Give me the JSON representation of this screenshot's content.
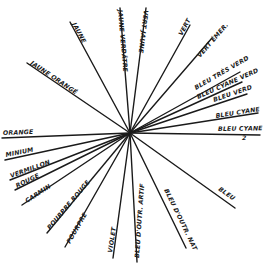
{
  "diagram": {
    "type": "radial-color-circle",
    "center": [
      130,
      133
    ],
    "ink_color": "#1a1a1a",
    "background": "#ffffff",
    "rays": [
      {
        "label": "JAUNE",
        "end": [
          70,
          22
        ],
        "text_pos": [
          72,
          24
        ],
        "text_angle": 61.5
      },
      {
        "label": "JAUNE VERDÂTRE",
        "end": [
          120,
          8
        ],
        "text_pos": [
          118,
          10
        ],
        "text_angle": 85
      },
      {
        "label": "VERT JAUNE",
        "end": [
          146,
          8
        ],
        "text_pos": [
          144,
          10
        ],
        "text_angle": 97
      },
      {
        "label": "VERT",
        "end": [
          190,
          25
        ],
        "text_pos": [
          182,
          36
        ],
        "text_angle": -61
      },
      {
        "label": "VERT ÉMER.",
        "end": [
          212,
          38
        ],
        "text_pos": [
          200,
          58
        ],
        "text_angle": -49
      },
      {
        "label": "BLEU TRÈS VERD",
        "end": [
          240,
          72
        ],
        "text_pos": [
          196,
          90
        ],
        "text_angle": -30
      },
      {
        "label": "BLEU CYANE VERD",
        "end": [
          242,
          82
        ],
        "text_pos": [
          198,
          99
        ],
        "text_angle": -24
      },
      {
        "label": "BLEU VERD",
        "end": [
          247,
          94
        ],
        "text_pos": [
          214,
          102
        ],
        "text_angle": -19
      },
      {
        "label": "BLEU CYANE",
        "end": [
          258,
          113
        ],
        "text_pos": [
          216,
          118
        ],
        "text_angle": -9
      },
      {
        "label": "BLEU CYANE",
        "subscript": "2",
        "end": [
          260,
          135
        ],
        "text_pos": [
          218,
          131
        ],
        "text_angle": -1
      },
      {
        "label": "BLEU",
        "end": [
          235,
          208
        ],
        "text_pos": [
          218,
          190
        ],
        "text_angle": 35
      },
      {
        "label": "BLEU D'OUTR. NAT",
        "end": [
          186,
          248
        ],
        "text_pos": [
          164,
          190
        ],
        "text_angle": 64
      },
      {
        "label": "BLEU D'OUTR. ARTIF",
        "end": [
          137,
          262
        ],
        "text_pos": [
          139,
          258
        ],
        "text_angle": -86
      },
      {
        "label": "VIOLET",
        "end": [
          113,
          258
        ],
        "text_pos": [
          112,
          253
        ],
        "text_angle": -81
      },
      {
        "label": "POURPRE",
        "end": [
          65,
          247
        ],
        "text_pos": [
          70,
          244
        ],
        "text_angle": -60
      },
      {
        "label": "POURPRE ROUGE",
        "end": [
          47,
          233
        ],
        "text_pos": [
          50,
          230
        ],
        "text_angle": -50
      },
      {
        "label": "CARMIN",
        "end": [
          22,
          205
        ],
        "text_pos": [
          27,
          203
        ],
        "text_angle": -33
      },
      {
        "label": "ROUGE",
        "end": [
          15,
          190
        ],
        "text_pos": [
          17,
          188
        ],
        "text_angle": -26
      },
      {
        "label": "VERMILLON",
        "end": [
          10,
          180
        ],
        "text_pos": [
          11,
          178
        ],
        "text_angle": -20
      },
      {
        "label": "MINIUM",
        "end": [
          5,
          160
        ],
        "text_pos": [
          6,
          157
        ],
        "text_angle": -11
      },
      {
        "label": "ORANGE",
        "end": [
          2,
          138
        ],
        "text_pos": [
          3,
          135
        ],
        "text_angle": -2
      },
      {
        "label": "JAUNE ORANGÉ",
        "end": [
          27,
          63
        ],
        "text_pos": [
          30,
          64
        ],
        "text_angle": 34
      }
    ]
  }
}
